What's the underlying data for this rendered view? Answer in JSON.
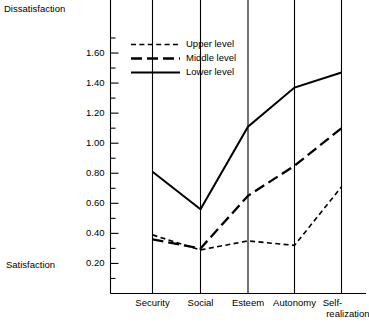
{
  "chart_data": {
    "type": "line",
    "title": "",
    "xlabel": "",
    "ylabel": "",
    "axis_end_labels": {
      "top": "Dissatisfaction",
      "bottom": "Satisfaction"
    },
    "categories": [
      "Security",
      "Social",
      "Esteem",
      "Autonomy",
      "Self-realization"
    ],
    "category_lines": [
      [
        "Security"
      ],
      [
        "Social"
      ],
      [
        "Esteem"
      ],
      [
        "Autonomy"
      ],
      [
        "Self-",
        "realization"
      ]
    ],
    "ylim": [
      0.0,
      1.75
    ],
    "ytick_labels": [
      "0.20",
      "0.40",
      "0.60",
      "0.80",
      "1.00",
      "1.20",
      "1.40",
      "1.60"
    ],
    "ytick_values": [
      0.2,
      0.4,
      0.6,
      0.8,
      1.0,
      1.2,
      1.4,
      1.6
    ],
    "yminor_values": [
      0.1,
      0.3,
      0.5,
      0.7,
      0.9,
      1.1,
      1.3,
      1.5,
      1.7
    ],
    "grid": "vertical-category-lines",
    "legend_position": "upper-left-inside",
    "series": [
      {
        "name": "Upper level",
        "style": "short-dash",
        "values": [
          0.39,
          0.29,
          0.35,
          0.32,
          0.71
        ]
      },
      {
        "name": "Middle level",
        "style": "long-dash",
        "values": [
          0.36,
          0.3,
          0.65,
          0.85,
          1.1
        ]
      },
      {
        "name": "Lower level",
        "style": "solid",
        "values": [
          0.81,
          0.56,
          1.11,
          1.37,
          1.47
        ]
      }
    ],
    "colors": {
      "ink": "#000000",
      "background": "#ffffff"
    }
  }
}
